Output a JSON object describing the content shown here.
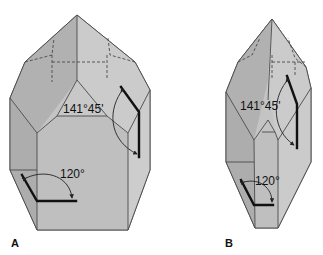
{
  "figure": {
    "panels": [
      {
        "id": "A",
        "label": "A",
        "interfacial_angle": "141°45'",
        "prism_angle": "120°"
      },
      {
        "id": "B",
        "label": "B",
        "interfacial_angle": "141°45'",
        "prism_angle": "120°"
      }
    ],
    "colors": {
      "face_light": "#c9c9c9",
      "face_mid": "#bdbdbd",
      "face_dark": "#a9a9a9",
      "edge": "#4a4a4a",
      "marker": "#111111"
    }
  }
}
